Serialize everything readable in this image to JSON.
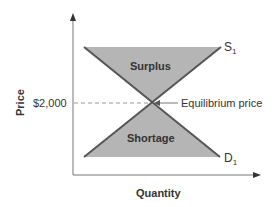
{
  "diagram": {
    "y_axis_label": "Price",
    "x_axis_label": "Quantity",
    "price_tick": "$2,000",
    "surplus_label": "Surplus",
    "shortage_label": "Shortage",
    "equilibrium_label": "Equilibrium price",
    "supply_label": "S",
    "supply_sub": "1",
    "demand_label": "D",
    "demand_sub": "1"
  },
  "colors": {
    "fill": "#b5b5b5",
    "line": "#555555",
    "axis": "#777777"
  }
}
